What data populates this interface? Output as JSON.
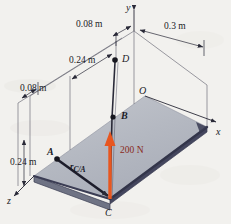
{
  "figure": {
    "background_color": "#f2f1ee",
    "plate_top_color": "#b9bcc4",
    "plate_edge_color": "#3a3c52",
    "force_color": "#e8561f",
    "force_label_color": "#8a2a20",
    "line_color": "#2a2a38"
  },
  "dimensions": {
    "top_left": "0.08 m",
    "top_right": "0.3 m",
    "diagonal": "0.24 m",
    "left_upper": "0.08 m",
    "left_lower": "0.24 m"
  },
  "points": {
    "d": "D",
    "o": "O",
    "b": "B",
    "a": "A",
    "c": "C"
  },
  "axes": {
    "x": "x",
    "y": "y",
    "z": "z"
  },
  "force": {
    "magnitude": "200 N"
  },
  "vector": {
    "symbol": "r",
    "subscript": "C/A"
  }
}
